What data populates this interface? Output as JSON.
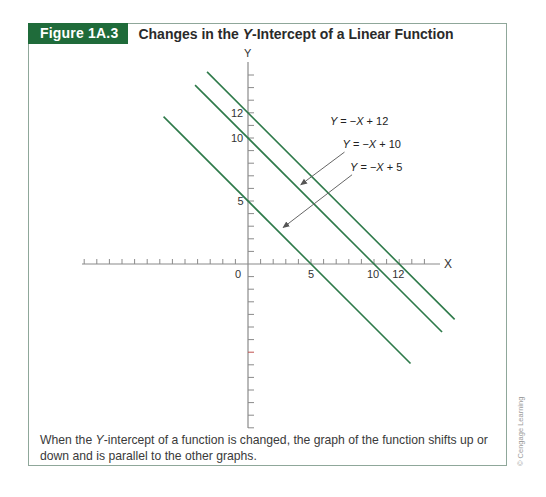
{
  "figure": {
    "tag": "Figure 1A.3",
    "title_prefix": "Changes in the ",
    "title_italic": "Y",
    "title_suffix": "-Intercept of a Linear Function",
    "caption_prefix": "When the ",
    "caption_italic": "Y",
    "caption_suffix": "-intercept of a function is changed, the graph of the function shifts up or down and is parallel to the other graphs.",
    "credit": "© Cengage Learning",
    "colors": {
      "tag_bg": "#1f6b3a",
      "line": "#2e7a4a",
      "axis": "#8a8a8a",
      "border": "#8fa79a"
    }
  },
  "chart_data": {
    "type": "line",
    "title": "Changes in the Y-Intercept of a Linear Function",
    "xlabel": "X",
    "ylabel": "Y",
    "xlim": [
      -13,
      15
    ],
    "ylim": [
      -13,
      15
    ],
    "grid": false,
    "x_tick_labels": [
      {
        "value": 0,
        "label": "0"
      },
      {
        "value": 5,
        "label": "5"
      },
      {
        "value": 10,
        "label": "10"
      },
      {
        "value": 12,
        "label": "12"
      }
    ],
    "y_tick_labels": [
      {
        "value": 5,
        "label": "5"
      },
      {
        "value": 10,
        "label": "10"
      },
      {
        "value": 12,
        "label": "12"
      }
    ],
    "series": [
      {
        "name": "Y = −X + 12",
        "slope": -1,
        "intercept": 12,
        "x": [
          -3.25,
          16.4
        ],
        "y": [
          15.25,
          -4.4
        ]
      },
      {
        "name": "Y = −X + 10",
        "slope": -1,
        "intercept": 10,
        "x": [
          -4.2,
          15.4
        ],
        "y": [
          14.2,
          -5.4
        ]
      },
      {
        "name": "Y = −X + 5",
        "slope": -1,
        "intercept": 5,
        "x": [
          -6.7,
          12.9
        ],
        "y": [
          11.7,
          -7.9
        ]
      }
    ],
    "annotations": [
      {
        "text": "Y = −X + 12",
        "x": 6.5,
        "y": 11.0
      },
      {
        "text": "Y = −X + 10",
        "x": 7.5,
        "y": 9.2,
        "arrow_to": [
          4.2,
          6.3
        ]
      },
      {
        "text": "Y = −X + 5",
        "x": 8.1,
        "y": 7.4,
        "arrow_to": [
          2.8,
          2.9
        ]
      }
    ]
  }
}
